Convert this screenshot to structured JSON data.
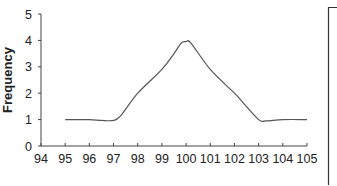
{
  "chart_data": {
    "type": "line",
    "title": "",
    "xlabel": "",
    "ylabel": "Frequency",
    "xlim": [
      94,
      105
    ],
    "ylim": [
      0,
      5
    ],
    "x_ticks": [
      94,
      95,
      96,
      97,
      98,
      99,
      100,
      101,
      102,
      103,
      104,
      105
    ],
    "y_ticks": [
      0,
      1,
      2,
      3,
      4,
      5
    ],
    "grid": false,
    "legend": null,
    "series": [
      {
        "name": "Frequency",
        "color": "#555555",
        "x": [
          95,
          96,
          96.5,
          97,
          97.3,
          98,
          99,
          99.5,
          99.8,
          100,
          100.2,
          101,
          102,
          102.3,
          103,
          103.3,
          104,
          105
        ],
        "y": [
          1.0,
          1.0,
          0.97,
          0.97,
          1.15,
          2.0,
          2.9,
          3.5,
          3.9,
          3.95,
          3.9,
          2.9,
          2.0,
          1.7,
          1.0,
          0.95,
          1.0,
          1.0
        ]
      }
    ]
  }
}
